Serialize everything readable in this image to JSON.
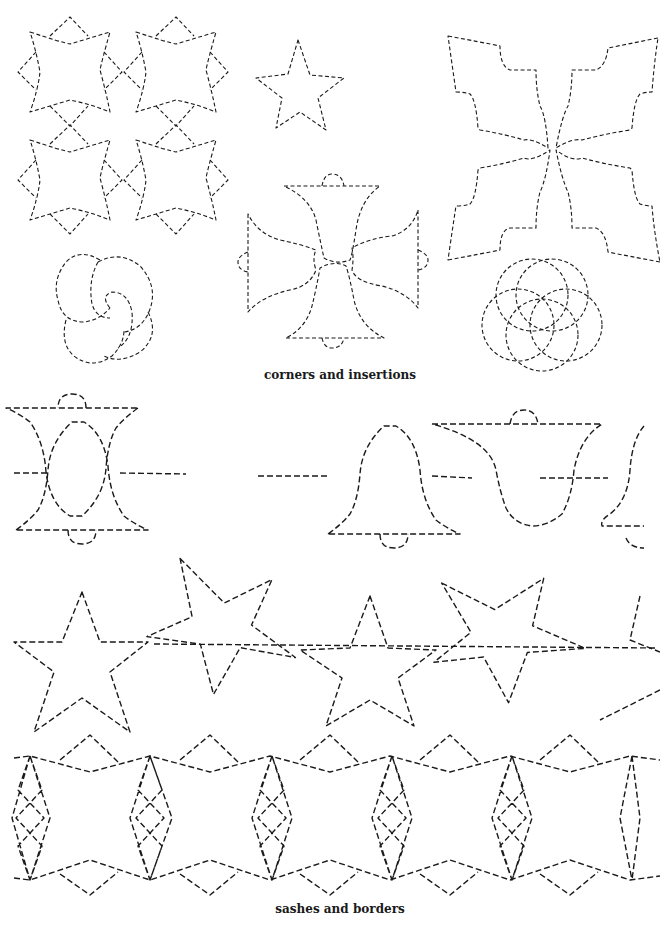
{
  "page": {
    "background": "#ffffff",
    "ink_color": "#1a1a1a"
  },
  "sections": [
    {
      "caption": "corners and insertions",
      "patterns": [
        "four-star-block",
        "small-five-point-star",
        "holly-leaf-cross",
        "interlocking-rings-swirl",
        "maltese-bell-cross",
        "overlapping-circles"
      ]
    },
    {
      "caption": "sashes and borders",
      "patterns": [
        "bell-border",
        "star-border",
        "diamond-lattice-border"
      ]
    }
  ]
}
